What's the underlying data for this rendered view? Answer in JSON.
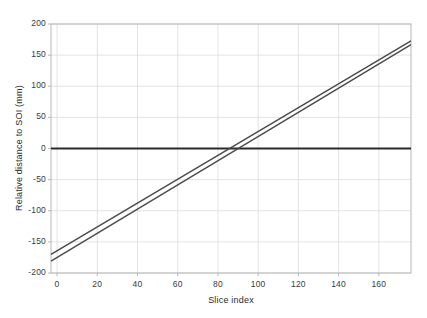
{
  "chart_data": {
    "type": "line",
    "title": "",
    "xlabel": "Slice index",
    "ylabel": "Relative distance to SOI (mm)",
    "xlim": [
      -3,
      176
    ],
    "ylim": [
      -200,
      200
    ],
    "xticks": [
      0,
      20,
      40,
      60,
      80,
      100,
      120,
      140,
      160
    ],
    "yticks": [
      -200,
      -150,
      -100,
      -50,
      0,
      50,
      100,
      150,
      200
    ],
    "xtick_labels": [
      "0",
      "20",
      "40",
      "60",
      "80",
      "100",
      "120",
      "140",
      "160"
    ],
    "ytick_labels": [
      "-200",
      "-150",
      "-100",
      "-50",
      "0",
      "50",
      "100",
      "150",
      "200"
    ],
    "grid": true,
    "legend": "none",
    "series": [
      {
        "name": "zero-reference",
        "color": "#2b2b2b",
        "width": 2.0,
        "x": [
          -3,
          176
        ],
        "values": [
          0,
          0
        ]
      },
      {
        "name": "upper-line",
        "color": "#4a4a4a",
        "width": 1.4,
        "x": [
          -3,
          176
        ],
        "values": [
          -170,
          173
        ]
      },
      {
        "name": "lower-line",
        "color": "#4a4a4a",
        "width": 1.4,
        "x": [
          -3,
          176
        ],
        "values": [
          -181,
          167
        ]
      }
    ]
  },
  "axes": {
    "x_tick_labels": [
      "0",
      "20",
      "40",
      "60",
      "80",
      "100",
      "120",
      "140",
      "160"
    ],
    "y_tick_labels": [
      "200",
      "150",
      "100",
      "50",
      "0",
      "-50",
      "-100",
      "-150",
      "-200"
    ],
    "x_title": "Slice index",
    "y_title": "Relative distance to SOI (mm)"
  },
  "colors": {
    "background": "#ffffff",
    "grid": "#dcdcdc",
    "axis_line": "#b0b0b0",
    "data_line": "#4a4a4a",
    "zero_line": "#2b2b2b",
    "text": "#3a3a3a"
  }
}
